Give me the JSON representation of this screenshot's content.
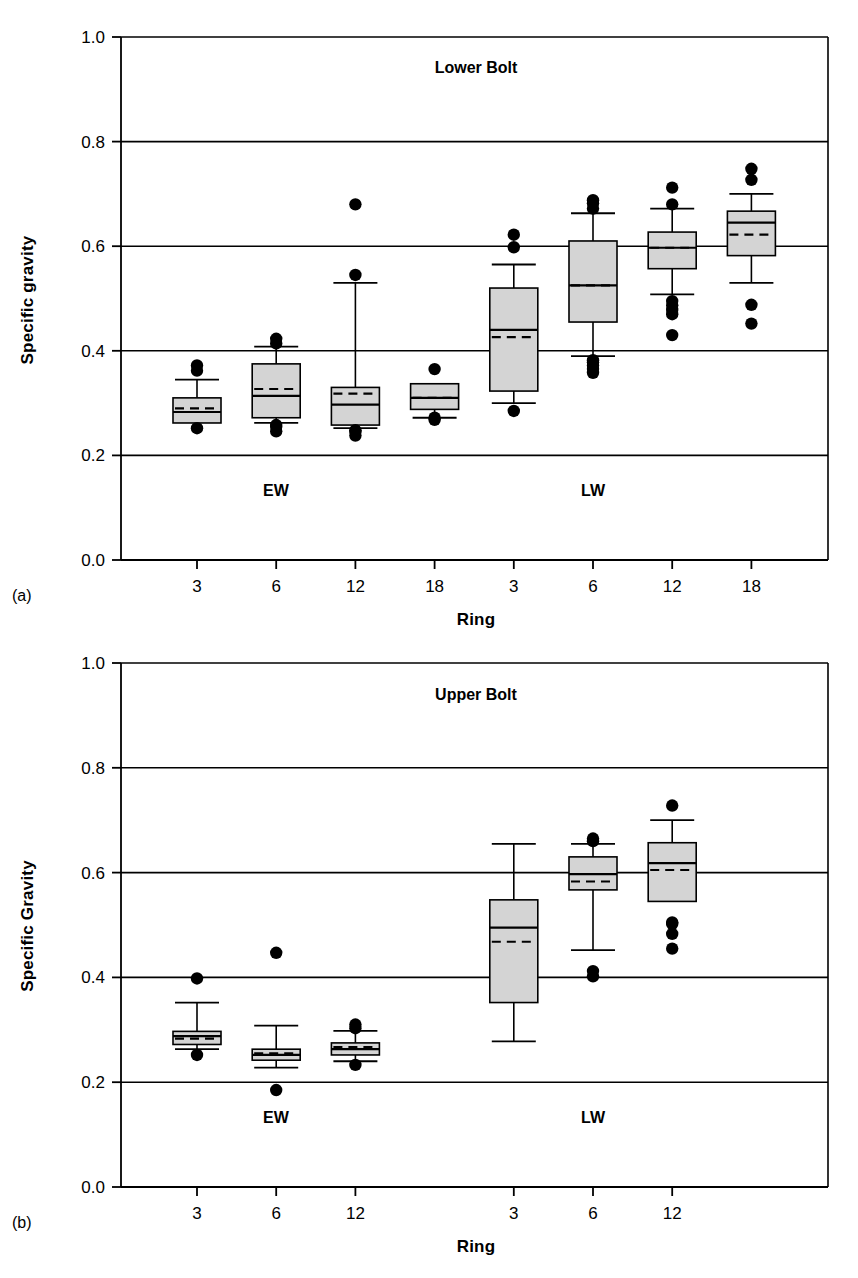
{
  "figure": {
    "background": "#ffffff",
    "line_color": "#000000",
    "box_fill": "#d4d4d4",
    "box_stroke": "#000000",
    "outlier_color": "#000000"
  },
  "panels": [
    {
      "tag": "(a)",
      "title": "Lower Bolt",
      "ylabel": "Specific gravity",
      "xlabel": "Ring",
      "group_labels": [
        "EW",
        "LW"
      ],
      "chart_data": {
        "type": "box",
        "title": "Lower Bolt",
        "xlabel": "Ring",
        "ylabel": "Specific gravity",
        "ylim": [
          0.0,
          1.0
        ],
        "yticks": [
          "0.0",
          "0.2",
          "0.4",
          "0.6",
          "0.8",
          "1.0"
        ],
        "ytick_values": [
          0.0,
          0.2,
          0.4,
          0.6,
          0.8,
          1.0
        ],
        "grid": "horizontal",
        "categories": [
          "3",
          "6",
          "12",
          "18",
          "3",
          "6",
          "12",
          "18"
        ],
        "groups": [
          "EW",
          "EW",
          "EW",
          "EW",
          "LW",
          "LW",
          "LW",
          "LW"
        ],
        "boxes": [
          {
            "group": "EW",
            "ring": "3",
            "whisker_low": 0.262,
            "q1": 0.262,
            "median": 0.283,
            "mean": 0.29,
            "q3": 0.31,
            "whisker_high": 0.345,
            "outliers": [
              0.252,
              0.362,
              0.372
            ]
          },
          {
            "group": "EW",
            "ring": "6",
            "whisker_low": 0.262,
            "q1": 0.272,
            "median": 0.314,
            "mean": 0.327,
            "q3": 0.375,
            "whisker_high": 0.408,
            "outliers": [
              0.246,
              0.255,
              0.258,
              0.414,
              0.423
            ]
          },
          {
            "group": "EW",
            "ring": "12",
            "whisker_low": 0.252,
            "q1": 0.258,
            "median": 0.297,
            "mean": 0.318,
            "q3": 0.33,
            "whisker_high": 0.53,
            "outliers": [
              0.238,
              0.245,
              0.248,
              0.545,
              0.68
            ]
          },
          {
            "group": "EW",
            "ring": "18",
            "whisker_low": 0.272,
            "q1": 0.288,
            "median": 0.31,
            "mean": 0.31,
            "q3": 0.337,
            "whisker_high": 0.337,
            "outliers": [
              0.268,
              0.272,
              0.365
            ]
          },
          {
            "group": "LW",
            "ring": "3",
            "whisker_low": 0.3,
            "q1": 0.323,
            "median": 0.44,
            "mean": 0.426,
            "q3": 0.52,
            "whisker_high": 0.565,
            "outliers": [
              0.285,
              0.598,
              0.622
            ]
          },
          {
            "group": "LW",
            "ring": "6",
            "whisker_low": 0.39,
            "q1": 0.455,
            "median": 0.525,
            "mean": 0.525,
            "q3": 0.61,
            "whisker_high": 0.663,
            "outliers": [
              0.358,
              0.365,
              0.372,
              0.378,
              0.382,
              0.672,
              0.682,
              0.688
            ]
          },
          {
            "group": "LW",
            "ring": "12",
            "whisker_low": 0.508,
            "q1": 0.557,
            "median": 0.597,
            "mean": 0.597,
            "q3": 0.627,
            "whisker_high": 0.672,
            "outliers": [
              0.43,
              0.47,
              0.478,
              0.487,
              0.495,
              0.68,
              0.712
            ]
          },
          {
            "group": "LW",
            "ring": "18",
            "whisker_low": 0.53,
            "q1": 0.582,
            "median": 0.645,
            "mean": 0.622,
            "q3": 0.667,
            "whisker_high": 0.7,
            "outliers": [
              0.452,
              0.488,
              0.727,
              0.748
            ]
          }
        ]
      }
    },
    {
      "tag": "(b)",
      "title": "Upper Bolt",
      "ylabel": "Specific Gravity",
      "xlabel": "Ring",
      "group_labels": [
        "EW",
        "LW"
      ],
      "chart_data": {
        "type": "box",
        "title": "Upper Bolt",
        "xlabel": "Ring",
        "ylabel": "Specific Gravity",
        "ylim": [
          0.0,
          1.0
        ],
        "yticks": [
          "0.0",
          "0.2",
          "0.4",
          "0.6",
          "0.8",
          "1.0"
        ],
        "ytick_values": [
          0.0,
          0.2,
          0.4,
          0.6,
          0.8,
          1.0
        ],
        "grid": "horizontal",
        "categories": [
          "3",
          "6",
          "12",
          "3",
          "6",
          "12"
        ],
        "groups": [
          "EW",
          "EW",
          "EW",
          "LW",
          "LW",
          "LW"
        ],
        "boxes": [
          {
            "group": "EW",
            "ring": "3",
            "whisker_low": 0.263,
            "q1": 0.272,
            "median": 0.288,
            "mean": 0.283,
            "q3": 0.297,
            "whisker_high": 0.352,
            "outliers": [
              0.252,
              0.398
            ]
          },
          {
            "group": "EW",
            "ring": "6",
            "whisker_low": 0.228,
            "q1": 0.242,
            "median": 0.252,
            "mean": 0.255,
            "q3": 0.263,
            "whisker_high": 0.308,
            "outliers": [
              0.185,
              0.447
            ]
          },
          {
            "group": "EW",
            "ring": "12",
            "whisker_low": 0.24,
            "q1": 0.252,
            "median": 0.263,
            "mean": 0.267,
            "q3": 0.275,
            "whisker_high": 0.298,
            "outliers": [
              0.233,
              0.303,
              0.31
            ]
          },
          {
            "group": "LW",
            "ring": "3",
            "whisker_low": 0.278,
            "q1": 0.352,
            "median": 0.495,
            "mean": 0.468,
            "q3": 0.548,
            "whisker_high": 0.655,
            "outliers": []
          },
          {
            "group": "LW",
            "ring": "6",
            "whisker_low": 0.452,
            "q1": 0.567,
            "median": 0.597,
            "mean": 0.583,
            "q3": 0.63,
            "whisker_high": 0.655,
            "outliers": [
              0.402,
              0.412,
              0.66,
              0.665
            ]
          },
          {
            "group": "LW",
            "ring": "12",
            "whisker_low": 0.545,
            "q1": 0.545,
            "median": 0.618,
            "mean": 0.605,
            "q3": 0.657,
            "whisker_high": 0.7,
            "outliers": [
              0.455,
              0.483,
              0.502,
              0.505,
              0.728
            ]
          }
        ]
      }
    }
  ]
}
